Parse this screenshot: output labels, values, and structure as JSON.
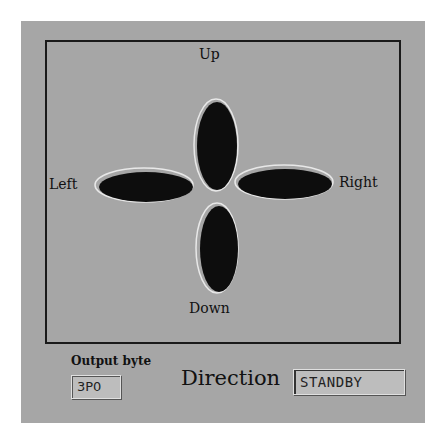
{
  "pad": {
    "up_label": "Up",
    "down_label": "Down",
    "left_label": "Left",
    "right_label": "Right"
  },
  "output": {
    "label": "Output byte",
    "value": "3P0"
  },
  "direction": {
    "label": "Direction",
    "value": "STANDBY"
  },
  "colors": {
    "panel_bg": "#a6a6a6",
    "button_fill": "#0d0d0d",
    "frame": "#1a1a1a"
  }
}
